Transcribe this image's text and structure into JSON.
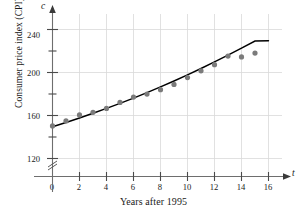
{
  "chart_data": {
    "type": "scatter",
    "title": "",
    "subtitle": "",
    "xlabel": "Years after 1995",
    "ylabel": "Consumer price index (CPI)",
    "x_axis_variable": "t",
    "y_axis_variable": "c",
    "xlim": [
      0,
      16.6
    ],
    "ylim": [
      110,
      250
    ],
    "y_axis_break": true,
    "y_axis_break_symbol": "≈",
    "grid": true,
    "grid_x_values": [
      2,
      4,
      6,
      8,
      10,
      12,
      14,
      16
    ],
    "grid_y_values": [
      120,
      160,
      200,
      240
    ],
    "legend": "none",
    "xticks": [
      0,
      2,
      4,
      6,
      8,
      10,
      12,
      14,
      16
    ],
    "xtick_labels": [
      "0",
      "2",
      "4",
      "6",
      "8",
      "10",
      "12",
      "14",
      "16"
    ],
    "xminor_ticks": [
      1,
      3,
      5,
      7,
      9,
      11,
      13,
      15
    ],
    "yticks": [
      120,
      160,
      200,
      240
    ],
    "ytick_labels": [
      "120",
      "160",
      "200",
      "240"
    ],
    "yminor_ticks": [
      140,
      180,
      220
    ],
    "x": [
      0,
      1,
      2,
      3,
      4,
      5,
      6,
      7,
      8,
      9,
      10,
      11,
      12,
      13,
      14,
      15
    ],
    "values": [
      150.3,
      155.0,
      160.5,
      163.0,
      166.6,
      172.2,
      177.1,
      179.9,
      184.0,
      188.9,
      195.3,
      201.6,
      207.3,
      215.3,
      214.5,
      218.1
    ],
    "series": [
      {
        "name": "Consumer price index",
        "marker": "circle",
        "marker_color": "#7b7b7b",
        "values": [
          150.3,
          155.0,
          160.5,
          163.0,
          166.6,
          172.2,
          177.1,
          179.9,
          184.0,
          188.9,
          195.3,
          201.6,
          207.3,
          215.3,
          214.5,
          218.1
        ]
      }
    ],
    "fit_curve": {
      "name": "trend curve",
      "color": "#000000",
      "x": [
        0,
        1,
        2,
        3,
        4,
        5,
        6,
        7,
        8,
        9,
        10,
        11,
        12,
        13,
        14,
        15,
        16
      ],
      "y": [
        149.5,
        153.5,
        157.7,
        162.1,
        166.6,
        171.3,
        176.2,
        181.3,
        186.6,
        192.1,
        197.8,
        203.7,
        209.8,
        216.1,
        222.6,
        229.3,
        229.5
      ]
    },
    "colors": {
      "marker": "#7b7b7b",
      "curve": "#000000",
      "axis": "#6e6e6e",
      "grid": "#d9d9d9",
      "text": "#1a1a1a"
    }
  }
}
